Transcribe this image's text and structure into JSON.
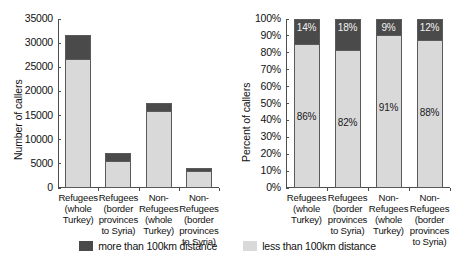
{
  "legend": {
    "entries": [
      {
        "label": "more than 100km distance",
        "color": "#4a4a4a",
        "swatch": "dark-swatch-icon"
      },
      {
        "label": "less than 100km distance",
        "color": "#d9d9d9",
        "swatch": "light-swatch-icon"
      }
    ]
  },
  "chart_data": [
    {
      "type": "bar",
      "title": "",
      "xlabel": "",
      "ylabel": "Number of callers",
      "ylim": [
        0,
        35000
      ],
      "yticks": [
        "0",
        "5000",
        "10000",
        "15000",
        "20000",
        "25000",
        "30000",
        "35000"
      ],
      "ytick_values": [
        0,
        5000,
        10000,
        15000,
        20000,
        25000,
        30000,
        35000
      ],
      "grid": false,
      "stacked": true,
      "legend_position": "bottom",
      "categories": [
        "Refugees (whole Turkey)",
        "Refugees (border provinces to Syria)",
        "Non-Refugees (whole Turkey)",
        "Non-Refugees (border provinces to Syria)"
      ],
      "category_lines": [
        [
          "Refugees",
          "(whole",
          "Turkey)"
        ],
        [
          "Refugees",
          "(border",
          "provinces",
          "to Syria)"
        ],
        [
          "Non-",
          "Refugees",
          "(whole",
          "Turkey)"
        ],
        [
          "Non-",
          "Refugees",
          "(border",
          "provinces",
          "to Syria)"
        ]
      ],
      "series": [
        {
          "name": "less than 100km distance",
          "color": "#d9d9d9",
          "values": [
            27000,
            5900,
            16100,
            3800
          ]
        },
        {
          "name": "more than 100km distance",
          "color": "#4a4a4a",
          "values": [
            4700,
            1300,
            1600,
            300
          ]
        }
      ],
      "totals": [
        31700,
        7200,
        17700,
        4100
      ]
    },
    {
      "type": "bar",
      "title": "",
      "xlabel": "",
      "ylabel": "Percent of callers",
      "ylim": [
        0,
        100
      ],
      "yticks": [
        "0%",
        "10%",
        "20%",
        "30%",
        "40%",
        "50%",
        "60%",
        "70%",
        "80%",
        "90%",
        "100%"
      ],
      "ytick_values": [
        0,
        10,
        20,
        30,
        40,
        50,
        60,
        70,
        80,
        90,
        100
      ],
      "grid": false,
      "stacked": true,
      "legend_position": "bottom",
      "categories": [
        "Refugees (whole Turkey)",
        "Refugees (border provinces to Syria)",
        "Non-Refugees (whole Turkey)",
        "Non-Refugees (border provinces to Syria)"
      ],
      "category_lines": [
        [
          "Refugees",
          "(whole",
          "Turkey)"
        ],
        [
          "Refugees",
          "(border",
          "provinces",
          "to Syria)"
        ],
        [
          "Non-",
          "Refugees",
          "(whole",
          "Turkey)"
        ],
        [
          "Non-",
          "Refugees",
          "(border",
          "provinces",
          "to Syria)"
        ]
      ],
      "series": [
        {
          "name": "less than 100km distance",
          "color": "#d9d9d9",
          "values": [
            86,
            82,
            91,
            88
          ],
          "labels": [
            "86%",
            "82%",
            "91%",
            "88%"
          ]
        },
        {
          "name": "more than 100km distance",
          "color": "#4a4a4a",
          "values": [
            14,
            18,
            9,
            12
          ],
          "labels": [
            "14%",
            "18%",
            "9%",
            "12%"
          ]
        }
      ]
    }
  ]
}
